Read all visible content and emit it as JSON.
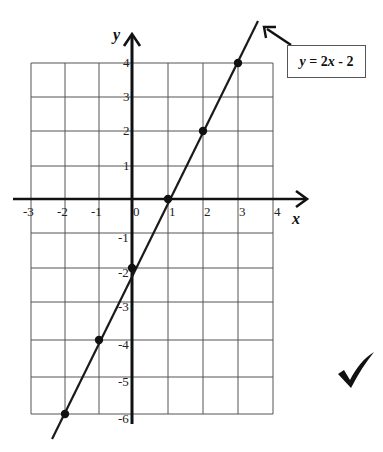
{
  "chart_data": {
    "type": "line",
    "title": "",
    "xlabel": "x",
    "ylabel": "y",
    "xlim": [
      -3,
      4
    ],
    "ylim": [
      -6,
      4
    ],
    "grid": true,
    "x_ticks": [
      "-3",
      "-2",
      "-1",
      "0",
      "1",
      "2",
      "3",
      "4"
    ],
    "y_ticks": [
      "4",
      "3",
      "2",
      "1",
      "-1",
      "-2",
      "-3",
      "-4",
      "-5",
      "-6"
    ],
    "series": [
      {
        "name": "y = 2x - 2",
        "equation": "y = 2x - 2",
        "points": [
          {
            "x": -2,
            "y": -6
          },
          {
            "x": -1,
            "y": -4
          },
          {
            "x": 0,
            "y": -2
          },
          {
            "x": 1,
            "y": 0
          },
          {
            "x": 2,
            "y": 2
          },
          {
            "x": 3,
            "y": 4
          }
        ]
      }
    ],
    "annotations": [
      {
        "text": "y = 2x - 2",
        "type": "boxed-label-with-arrow"
      },
      {
        "text": "✔",
        "type": "checkmark"
      }
    ]
  },
  "labels": {
    "x_axis": "x",
    "y_axis": "y",
    "equation_var": "y",
    "equation_eq": " = 2",
    "equation_x": "x",
    "equation_rest": " - 2",
    "checkmark": "✔"
  },
  "colors": {
    "grid": "#555555",
    "axis": "#111111",
    "line": "#1a1a1a",
    "point": "#111111"
  }
}
